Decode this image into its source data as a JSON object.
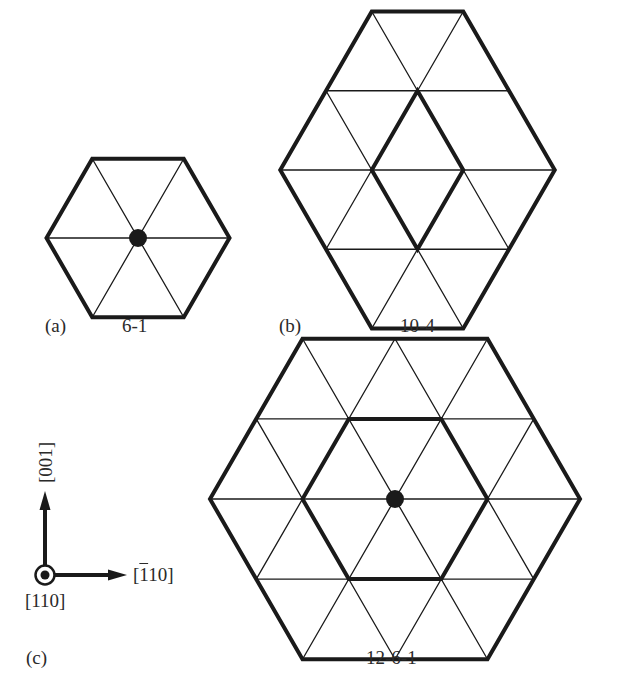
{
  "colors": {
    "line": "#1a1a1a",
    "text": "#2a2a2a",
    "background": "#ffffff"
  },
  "panels": [
    {
      "id": "a",
      "letter": "(a)",
      "name": "6-1",
      "center": [
        138,
        238
      ],
      "side": 91.5,
      "outer_radius": 1,
      "inner_radius": 0,
      "inner_shape": "none",
      "center_dot": true,
      "letter_pos": [
        45,
        316
      ],
      "name_pos": [
        122,
        316
      ]
    },
    {
      "id": "b",
      "letter": "(b)",
      "name": "10-4",
      "center": [
        417.5,
        170
      ],
      "side": 91.5,
      "outer_radius": 1.5,
      "inner_shape": "rhombus",
      "center_dot": false,
      "letter_pos": [
        279,
        316
      ],
      "name_pos": [
        400,
        316
      ]
    },
    {
      "id": "c",
      "letter": "(c)",
      "name": "12-6-1",
      "center": [
        395,
        499
      ],
      "side": 92.5,
      "outer_radius": 2,
      "inner_shape": "hexagon",
      "center_dot": true,
      "letter_pos": [
        26,
        648
      ],
      "name_pos": [
        366,
        648
      ]
    }
  ],
  "axes": {
    "origin": [
      45,
      575
    ],
    "vertical_label": "[001]",
    "horizontal_label_bar": "1",
    "horizontal_label_rest": "10",
    "horizontal_label_full": "[̅110]",
    "out_of_plane_label": "[110]",
    "vertical_label_pos": [
      45,
      462
    ],
    "horizontal_label_pos": [
      133,
      565
    ],
    "out_of_plane_label_pos": [
      25,
      591
    ]
  }
}
